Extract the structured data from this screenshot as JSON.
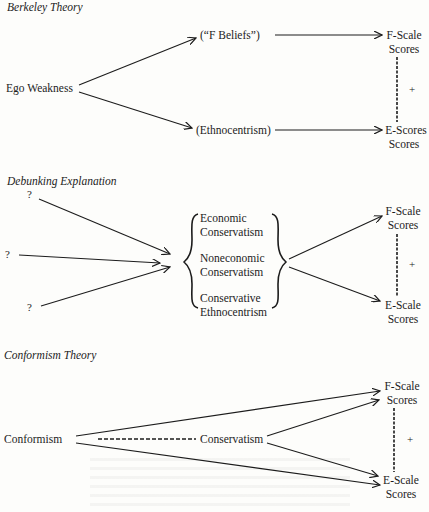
{
  "panels": [
    {
      "title": "Berkeley Theory",
      "nodes": {
        "source": "Ego Weakness",
        "mid_top": "(“F Beliefs”)",
        "mid_bottom": "(Ethnocentrism)",
        "out_top_1": "F-Scale",
        "out_top_2": "Scores",
        "out_bottom_1": "E-Scores",
        "out_bottom_2": "Scores"
      },
      "correlation_sign": "+"
    },
    {
      "title": "Debunking Explanation",
      "nodes": {
        "unknown_1": "?",
        "unknown_2": "?",
        "unknown_3": "?",
        "bracket_items": [
          [
            "Economic",
            "Conservatism"
          ],
          [
            "Noneconomic",
            "Conservatism"
          ],
          [
            "Conservative",
            "Ethnocentrism"
          ]
        ],
        "out_top_1": "F-Scale",
        "out_top_2": "Scores",
        "out_bottom_1": "E-Scale",
        "out_bottom_2": "Scores"
      },
      "correlation_sign": "+"
    },
    {
      "title": "Conformism Theory",
      "nodes": {
        "source": "Conformism",
        "mid": "Conservatism",
        "out_top_1": "F-Scale",
        "out_top_2": "Scores",
        "out_bottom_1": "E-Scale",
        "out_bottom_2": "Scores"
      },
      "correlation_sign": "+"
    }
  ],
  "colors": {
    "ink": "#1c1c1c",
    "paper": "#fdfdfb"
  }
}
